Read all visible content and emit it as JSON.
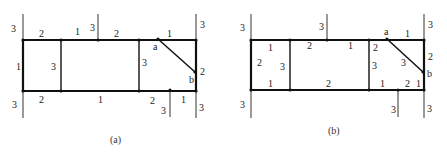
{
  "colors": {
    "line": "#111111",
    "thin_line": "#555555",
    "text": "#222222",
    "background": "#ffffff"
  },
  "diagrams": [
    {
      "caption": "(a)",
      "labels": {
        "top_left_outer": "3",
        "top_seg1": "2",
        "top_seg2": "1",
        "top_stub": "3",
        "top_seg3": "2",
        "top_seg4": "1",
        "right_top_outer": "3",
        "left_edge": "1",
        "inner_v1": "3",
        "inner_v2": "3",
        "right_edge": "2",
        "node_a": "a",
        "node_b": "b",
        "bottom_left_outer": "3",
        "bottom_seg1": "2",
        "bottom_seg2": "1",
        "bottom_seg3": "2",
        "bottom_stub": "3",
        "bottom_seg4": "1",
        "right_bottom_outer": "3"
      }
    },
    {
      "caption": "(b)",
      "labels": {
        "top_left_outer": "3",
        "top_stub": "3",
        "right_top_outer": "3",
        "node_a": "a",
        "top_seg4": "1",
        "cell1_top": "1",
        "cell1_left": "2",
        "cell1_right": "3",
        "cell1_bottom": "1",
        "cell2_top_left": "2",
        "cell2_top_right": "1",
        "cell2_bottom": "2",
        "cell3_top": "2",
        "cell3_left": "3",
        "cell3_diag": "3",
        "cell3_bottom": "1",
        "cell3_bottom_right": "2",
        "right_edge": "2",
        "node_b": "b",
        "right_lower": "1",
        "bottom_left_outer": "3",
        "bottom_stub": "3",
        "right_bottom_outer": "3"
      }
    }
  ]
}
